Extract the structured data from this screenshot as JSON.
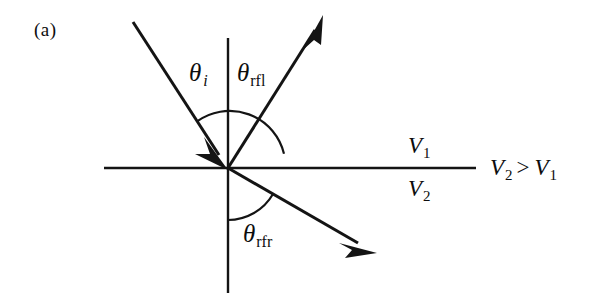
{
  "figure": {
    "panel_letter": "(a)",
    "caption_text": "",
    "background_color": "#ffffff",
    "stroke_color": "#111111"
  },
  "labels": {
    "theta_incident": {
      "symbol": "θ",
      "subscript": "i"
    },
    "theta_reflected": {
      "symbol": "θ",
      "subscript": "rfl"
    },
    "theta_refracted": {
      "symbol": "θ",
      "subscript": "rfr"
    },
    "velocity_upper": {
      "symbol": "V",
      "subscript": "1"
    },
    "velocity_lower": {
      "symbol": "V",
      "subscript": "2"
    },
    "inequality": {
      "left_symbol": "V",
      "left_subscript": "2",
      "operator": ">",
      "right_symbol": "V",
      "right_subscript": "1"
    }
  },
  "geometry": {
    "origin": {
      "x": 228,
      "y": 168
    },
    "interface_line": {
      "x1": 104,
      "y1": 168,
      "x2": 476,
      "y2": 168
    },
    "normal_line": {
      "x1": 228,
      "y1": 38,
      "x2": 228,
      "y2": 293
    },
    "incident_ray": {
      "x1": 133,
      "y1": 22,
      "x2": 228,
      "y2": 168,
      "arrow": "at-origin"
    },
    "reflected_ray": {
      "x1": 228,
      "y1": 168,
      "x2": 323,
      "y2": 17,
      "arrow": "at-end"
    },
    "refracted_ray": {
      "x1": 228,
      "y1": 168,
      "x2": 375,
      "y2": 252,
      "arrow": "at-end"
    },
    "arc_upper": {
      "radius": 56,
      "from_deg": 237,
      "to_deg": 302
    },
    "arc_lower": {
      "radius": 52,
      "from_deg": 90,
      "to_deg": 30
    }
  }
}
